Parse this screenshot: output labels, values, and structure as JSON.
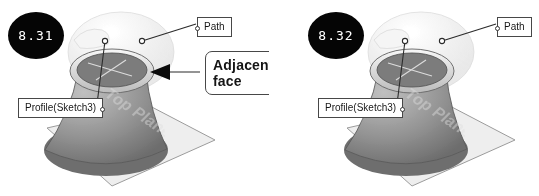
{
  "figure": {
    "background_color": "#ffffff",
    "badge_color": "#0b0b0b",
    "badge_text_color": "#ffffff",
    "line_color": "#3a3a3a",
    "model_color": "#8a8a8a",
    "plane_color": "#e6e6e6",
    "watermark_text": "Top Plane"
  },
  "panels": [
    {
      "id": "panel-1",
      "badge": "8.31",
      "labels": {
        "path": "Path",
        "profile": "Profile(Sketch3)",
        "adjacent_face": "Adjacent face"
      }
    },
    {
      "id": "panel-2",
      "badge": "8.32",
      "labels": {
        "path": "Path",
        "profile": "Profile(Sketch3)"
      }
    }
  ]
}
